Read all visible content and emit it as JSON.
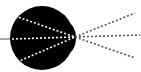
{
  "diagram": {
    "type": "eye-lens-ray-diagram",
    "colors": {
      "background": "#ffffff",
      "eyeball": "#000000",
      "internal_rays": "#ffffff",
      "external_rays": "#555555",
      "optic_nerve": "#888888"
    },
    "eyeball": {
      "cx": 42,
      "cy": 38,
      "rx": 32,
      "ry": 32
    },
    "cornea_bulge": {
      "cx": 66,
      "cy": 38,
      "rx": 10,
      "ry": 16
    },
    "focal_point": {
      "x": 75,
      "y": 37
    },
    "optic_nerve": {
      "x1": 0,
      "y1": 39,
      "x2": 12,
      "y2": 39
    },
    "internal_rays": [
      {
        "x1": 15,
        "y1": 16,
        "x2": 75,
        "y2": 37
      },
      {
        "x1": 12,
        "y1": 39,
        "x2": 75,
        "y2": 37
      },
      {
        "x1": 17,
        "y1": 62,
        "x2": 75,
        "y2": 37
      }
    ],
    "external_rays": [
      {
        "x1": 75,
        "y1": 37,
        "x2": 135,
        "y2": 13
      },
      {
        "x1": 75,
        "y1": 37,
        "x2": 140,
        "y2": 35
      },
      {
        "x1": 75,
        "y1": 37,
        "x2": 135,
        "y2": 58
      }
    ]
  }
}
